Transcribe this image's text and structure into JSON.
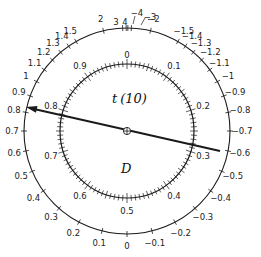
{
  "diagram": {
    "center_label_top": "t (10)",
    "center_label_top_var": "t",
    "center_label_top_df": "(10)",
    "center_label_bottom": "D",
    "colors": {
      "ink": "#1a1a1a",
      "background": "#ffffff"
    },
    "geometry": {
      "cx": 127,
      "cy": 131,
      "outer_r": 103,
      "inner_r": 67
    },
    "outer_scale": {
      "name": "t values (t distribution, 10 df)",
      "ticks": [
        {
          "label": "0",
          "cdf": 0.5
        },
        {
          "label": "0.1",
          "cdf": 0.5389
        },
        {
          "label": "0.2",
          "cdf": 0.5772
        },
        {
          "label": "0.3",
          "cdf": 0.6148
        },
        {
          "label": "0.4",
          "cdf": 0.6512
        },
        {
          "label": "0.5",
          "cdf": 0.686
        },
        {
          "label": "0.6",
          "cdf": 0.719
        },
        {
          "label": "0.7",
          "cdf": 0.75
        },
        {
          "label": "0.8",
          "cdf": 0.779
        },
        {
          "label": "0.9",
          "cdf": 0.8053
        },
        {
          "label": "1",
          "cdf": 0.8296
        },
        {
          "label": "1.1",
          "cdf": 0.8514
        },
        {
          "label": "1.2",
          "cdf": 0.871
        },
        {
          "label": "1.3",
          "cdf": 0.8886
        },
        {
          "label": "1.4",
          "cdf": 0.9041
        },
        {
          "label": "1.5",
          "cdf": 0.9177
        },
        {
          "label": "2",
          "cdf": 0.9633
        },
        {
          "label": "3",
          "cdf": 0.9933
        },
        {
          "label": "4",
          "cdf": 0.9987
        },
        {
          "label": "−0.1",
          "cdf": 0.4611
        },
        {
          "label": "−0.2",
          "cdf": 0.4228
        },
        {
          "label": "−0.3",
          "cdf": 0.3852
        },
        {
          "label": "−0.4",
          "cdf": 0.3488
        },
        {
          "label": "−0.5",
          "cdf": 0.314
        },
        {
          "label": "−0.6",
          "cdf": 0.281
        },
        {
          "label": "−0.7",
          "cdf": 0.25
        },
        {
          "label": "−0.8",
          "cdf": 0.221
        },
        {
          "label": "−0.9",
          "cdf": 0.1947
        },
        {
          "label": "−1",
          "cdf": 0.1704
        },
        {
          "label": "−1.1",
          "cdf": 0.1486
        },
        {
          "label": "−1.2",
          "cdf": 0.129
        },
        {
          "label": "−1.3",
          "cdf": 0.1114
        },
        {
          "label": "−1.4",
          "cdf": 0.0959
        },
        {
          "label": "−1.5",
          "cdf": 0.0823
        },
        {
          "label": "−2",
          "cdf": 0.0367
        },
        {
          "label": "−3",
          "cdf": 0.0067
        },
        {
          "label": "−4",
          "cdf": 0.0013
        }
      ]
    },
    "inner_scale": {
      "name": "D",
      "labels": [
        "0",
        "0.1",
        "0.2",
        "0.3",
        "0.4",
        "0.5",
        "0.6",
        "0.7",
        "0.8",
        "0.9"
      ],
      "minor_step": 0.01
    },
    "pointer": {
      "inner_reading": "0.3",
      "outer_reading": "0.8",
      "tip": [
        26,
        107
      ],
      "tail": [
        220,
        151
      ]
    }
  }
}
